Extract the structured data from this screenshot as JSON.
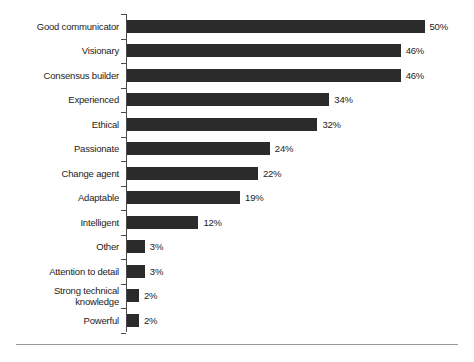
{
  "chart_data": {
    "type": "bar",
    "orientation": "horizontal",
    "title": "",
    "subtitle": "",
    "xlabel": "",
    "ylabel": "",
    "xlim": [
      0,
      50
    ],
    "grid": false,
    "legend": false,
    "value_suffix": "%",
    "categories": [
      "Good communicator",
      "Visionary",
      "Consensus builder",
      "Experienced",
      "Ethical",
      "Passionate",
      "Change agent",
      "Adaptable",
      "Intelligent",
      "Other",
      "Attention to detail",
      "Strong technical\nknowledge",
      "Powerful"
    ],
    "values": [
      50,
      46,
      46,
      34,
      32,
      24,
      22,
      19,
      12,
      3,
      3,
      2,
      2
    ],
    "value_labels": [
      "50%",
      "46%",
      "46%",
      "34%",
      "32%",
      "24%",
      "22%",
      "19%",
      "12%",
      "3%",
      "3%",
      "2%",
      "2%"
    ],
    "bar_color": "#2b2b2b",
    "axis_color": "#4a4a4a",
    "text_color": "#1c1c1c",
    "background_color": "#ffffff"
  }
}
